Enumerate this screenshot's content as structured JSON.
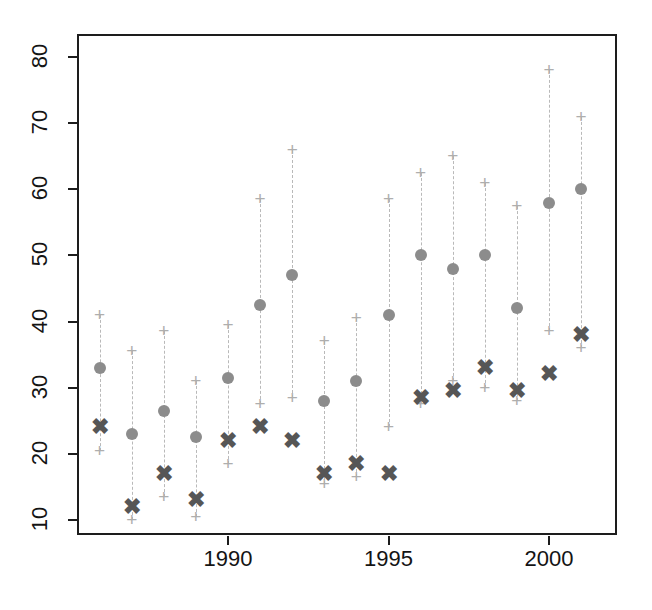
{
  "chart_data": {
    "type": "scatter",
    "title": "",
    "xlabel": "",
    "ylabel": "",
    "grid": false,
    "legend": "none",
    "xlim": [
      1985.3,
      2001.8
    ],
    "ylim": [
      8.2,
      82.5
    ],
    "xticks": [
      1990,
      1995,
      2000
    ],
    "xtick_labels": [
      "1990",
      "1995",
      "2000"
    ],
    "yticks": [
      10,
      20,
      30,
      40,
      50,
      60,
      70,
      80
    ],
    "ytick_labels": [
      "10",
      "20",
      "30",
      "40",
      "50",
      "60",
      "70",
      "80"
    ],
    "x": [
      1986,
      1987,
      1988,
      1989,
      1990,
      1991,
      1992,
      1993,
      1994,
      1995,
      1996,
      1997,
      1998,
      1999,
      2000,
      2001
    ],
    "series": [
      {
        "name": "circle-estimate",
        "marker": "circle",
        "color": "#8c8c8c",
        "values": [
          33,
          23,
          26.5,
          22.5,
          31.5,
          42.5,
          47,
          28,
          31,
          41,
          50,
          48,
          50,
          42,
          58,
          60
        ]
      },
      {
        "name": "x-estimate",
        "marker": "x",
        "color": "#565656",
        "values": [
          24,
          12,
          17,
          13,
          22,
          24,
          22,
          17,
          18.5,
          17,
          28.5,
          29.5,
          33,
          29.5,
          32,
          38
        ]
      },
      {
        "name": "interval-upper",
        "marker": "plus",
        "color": "#aeaeae",
        "values": [
          41,
          35.5,
          38.5,
          31,
          39.5,
          58.5,
          66,
          37,
          40.5,
          58.5,
          62.5,
          65,
          61,
          57.5,
          78,
          71
        ]
      },
      {
        "name": "interval-lower",
        "marker": "plus",
        "color": "#aeaeae",
        "values": [
          20.5,
          10,
          13.5,
          10.5,
          18.5,
          27.5,
          28.5,
          15.5,
          16.5,
          24,
          27.5,
          31,
          30,
          28,
          38.5,
          36
        ]
      }
    ]
  },
  "axis": {
    "y_tick_labels": [
      "80",
      "70",
      "60",
      "50",
      "40",
      "30",
      "20",
      "10"
    ],
    "x_tick_labels": [
      "1990",
      "1995",
      "2000"
    ]
  },
  "colors": {
    "frame": "#1d1d1d",
    "circle": "#8c8c8c",
    "cross": "#565656",
    "plus": "#aeaeae",
    "dash": "#b9b9b9",
    "background": "#ffffff"
  },
  "glyphs": {
    "cross": "✖",
    "plus": "+"
  }
}
